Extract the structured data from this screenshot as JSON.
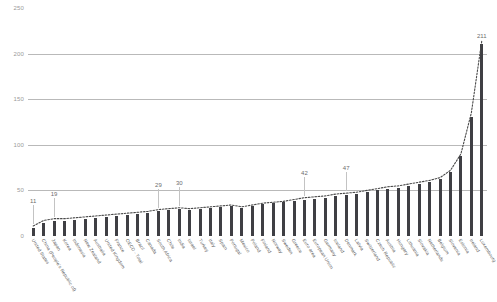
{
  "chart_data": {
    "type": "bar",
    "title": "",
    "subtitle": "",
    "xlabel": "",
    "ylabel": "",
    "ylim": [
      0,
      250
    ],
    "yticks": [
      0,
      50,
      100,
      150,
      200,
      250
    ],
    "grid": true,
    "legend": false,
    "legend_position": "none",
    "categories": [
      "United States",
      "China (People's Republic of)",
      "Japan",
      "Korea",
      "Indonesia",
      "New Zealand",
      "Australia",
      "United Kingdom",
      "France",
      "OECD - Total",
      "Brazil",
      "Canada",
      "South Africa",
      "Chile",
      "India",
      "Israel",
      "Turkey",
      "Italy",
      "Spain",
      "Portugal",
      "Mexico",
      "Poland",
      "Finland",
      "Norway",
      "Sweden",
      "Greece",
      "Euro area",
      "European Union",
      "Germany",
      "Iceland",
      "Denmark",
      "Latvia",
      "Switzerland",
      "Czech Republic",
      "Austria",
      "Hungary",
      "Lithuania",
      "Slovakia",
      "Netherlands",
      "Belgium",
      "Slovenia",
      "Estonia",
      "Ireland",
      "Luxembourg"
    ],
    "series": [
      {
        "name": "bars",
        "type": "bar",
        "values": [
          9,
          14,
          16,
          17,
          18,
          19,
          20,
          21,
          22,
          23,
          24,
          25,
          27,
          28,
          30,
          29,
          30,
          31,
          32,
          33,
          31,
          33,
          35,
          36,
          37,
          38,
          40,
          41,
          42,
          44,
          45,
          46,
          48,
          50,
          52,
          53,
          55,
          57,
          59,
          62,
          70,
          88,
          131,
          211
        ]
      },
      {
        "name": "dotted-line",
        "type": "line",
        "values": [
          11,
          17,
          19,
          19,
          20,
          21,
          22,
          23,
          24,
          25,
          26,
          27,
          29,
          30,
          31,
          30,
          31,
          32,
          33,
          34,
          32,
          34,
          36,
          37,
          38,
          40,
          42,
          43,
          44,
          46,
          47,
          48,
          50,
          52,
          54,
          55,
          57,
          59,
          61,
          64,
          72,
          90,
          135,
          214
        ]
      }
    ],
    "annotations": [
      {
        "label": "11",
        "category_index": 0
      },
      {
        "label": "19",
        "category_index": 2
      },
      {
        "label": "29",
        "category_index": 12
      },
      {
        "label": "30",
        "category_index": 14
      },
      {
        "label": "42",
        "category_index": 26
      },
      {
        "label": "47",
        "category_index": 30
      },
      {
        "label": "211",
        "category_index": 43
      }
    ],
    "colors": {
      "bar": "#3f3f44",
      "line": "#4a4a4a",
      "gridline": "#b9b9b9",
      "tick_text": "#9a9a9a",
      "category_text": "#585858",
      "annotation_text": "#6d6d6d",
      "background": "#ffffff"
    }
  }
}
